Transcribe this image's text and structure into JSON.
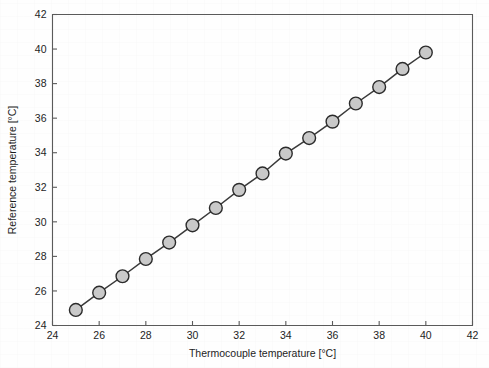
{
  "chart_data": {
    "type": "scatter",
    "title": "",
    "subtitle": "",
    "xlabel": "Thermocouple temperature [°C]",
    "ylabel": "Reference temperature [°C]",
    "xlim": [
      24,
      42
    ],
    "ylim": [
      24,
      42
    ],
    "xticks": [
      24,
      26,
      28,
      30,
      32,
      34,
      36,
      38,
      40,
      42
    ],
    "yticks": [
      24,
      26,
      28,
      30,
      32,
      34,
      36,
      38,
      40,
      42
    ],
    "xtick_labels": [
      "24",
      "26",
      "28",
      "30",
      "32",
      "34",
      "36",
      "38",
      "40",
      "42"
    ],
    "ytick_labels": [
      "24",
      "26",
      "28",
      "30",
      "32",
      "34",
      "36",
      "38",
      "40",
      "42"
    ],
    "grid": false,
    "legend": null,
    "legend_position": "none",
    "marker_style": "circle-filled-gray-outlined",
    "line_style": "solid",
    "annotations": [],
    "x": [
      25,
      26,
      27,
      28,
      29,
      30,
      31,
      32,
      33,
      34,
      35,
      36,
      37,
      38,
      39,
      40
    ],
    "y": [
      24.9,
      25.9,
      26.85,
      27.85,
      28.8,
      29.8,
      30.8,
      31.85,
      32.8,
      33.95,
      34.85,
      35.8,
      36.85,
      37.8,
      38.85,
      39.8
    ],
    "series": [
      {
        "name": "Thermocouple calibration",
        "x": [
          25,
          26,
          27,
          28,
          29,
          30,
          31,
          32,
          33,
          34,
          35,
          36,
          37,
          38,
          39,
          40
        ],
        "values": [
          24.9,
          25.9,
          26.85,
          27.85,
          28.8,
          29.8,
          30.8,
          31.85,
          32.8,
          33.95,
          34.85,
          35.8,
          36.85,
          37.8,
          38.85,
          39.8
        ]
      }
    ]
  },
  "colors": {
    "marker_fill": "#c9c9c9",
    "marker_stroke": "#2b2b2b",
    "line": "#3a3a3a",
    "axis": "#5a5a5a",
    "text": "#1d1d1d",
    "background": "#fefefe"
  }
}
